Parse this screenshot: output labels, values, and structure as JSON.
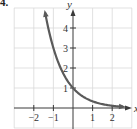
{
  "problem": {
    "label": "4."
  },
  "colors": {
    "grid": "#d9d9d9",
    "axis": "#3a3a3a",
    "curve": "#5a5a5a",
    "text": "#333333"
  },
  "chart_data": {
    "type": "line",
    "title": "",
    "xlabel": "x",
    "ylabel": "y",
    "function": "y = (1/3)^x",
    "xlim": [
      -3,
      3
    ],
    "ylim": [
      -0.3,
      5
    ],
    "grid": true,
    "legend": null,
    "x_ticks": [
      -2,
      -1,
      1,
      2
    ],
    "y_ticks": [
      1,
      2,
      3,
      4
    ],
    "x_tick_labels": [
      "−2",
      "−1",
      "1",
      "2"
    ],
    "y_tick_labels": [
      "1",
      "2",
      "3",
      "4"
    ],
    "series": [
      {
        "name": "curve",
        "x": [
          -1.45,
          -1.25,
          -1,
          -0.75,
          -0.5,
          -0.25,
          0,
          0.25,
          0.5,
          0.75,
          1,
          1.5,
          2,
          2.5
        ],
        "values": [
          4.92,
          3.95,
          3,
          2.28,
          1.73,
          1.32,
          1,
          0.76,
          0.58,
          0.44,
          0.33,
          0.19,
          0.11,
          0.06
        ]
      }
    ],
    "annotations": [
      "arrow at both ends of curve"
    ]
  }
}
